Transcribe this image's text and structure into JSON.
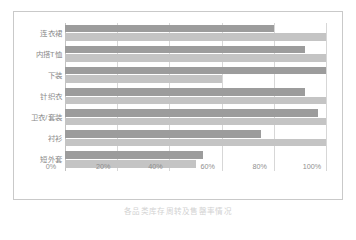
{
  "caption": "各品类库存周转及售罄率情况",
  "chart_data": {
    "type": "bar",
    "orientation": "horizontal",
    "title": "",
    "xlabel": "",
    "ylabel": "",
    "xlim": [
      0,
      100
    ],
    "grid": true,
    "legend": "none",
    "categories": [
      "连衣裙",
      "内搭T恤",
      "下装",
      "针织衣",
      "卫衣/套装",
      "衬衫",
      "短外套"
    ],
    "tick_labels": [
      "0%",
      "20%",
      "40%",
      "60%",
      "80%",
      "100%"
    ],
    "tick_values": [
      0,
      20,
      40,
      60,
      80,
      100
    ],
    "series": [
      {
        "name": "系列1",
        "color": "#9c9c9c",
        "values": [
          80,
          92,
          100,
          92,
          97,
          75,
          53
        ]
      },
      {
        "name": "系列2",
        "color": "#c4c4c4",
        "values": [
          100,
          100,
          60,
          100,
          100,
          100,
          50
        ]
      }
    ]
  },
  "colors": {
    "series_a": "#9c9c9c",
    "series_b": "#c4c4c4",
    "gridline": "#d7d7d7",
    "frame_border": "#c9c9c9",
    "label_text": "#8a8a8a",
    "caption_text": "#d2d2d2"
  }
}
